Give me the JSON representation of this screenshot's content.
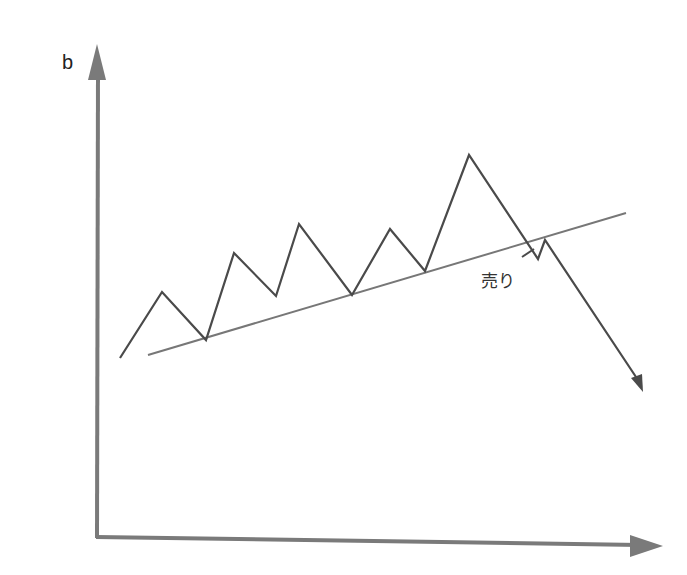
{
  "diagram": {
    "type": "line",
    "title": "",
    "panel_label": "b",
    "annotation": "売り",
    "colors": {
      "axis": "#7a7a7a",
      "price": "#4a4a4a",
      "trendline": "#777777",
      "background": "#ffffff"
    },
    "price_path": [
      [
        0,
        0
      ],
      [
        1,
        3
      ],
      [
        2,
        1
      ],
      [
        3,
        5
      ],
      [
        4,
        3
      ],
      [
        5,
        6.5
      ],
      [
        6,
        3.2
      ],
      [
        7,
        6.3
      ],
      [
        8,
        4.2
      ],
      [
        9,
        9.5
      ],
      [
        10,
        4.6
      ],
      [
        10.3,
        5.3
      ],
      [
        13,
        -3.5
      ]
    ],
    "trendline": [
      [
        0.5,
        0
      ],
      [
        13,
        6.3
      ]
    ]
  }
}
